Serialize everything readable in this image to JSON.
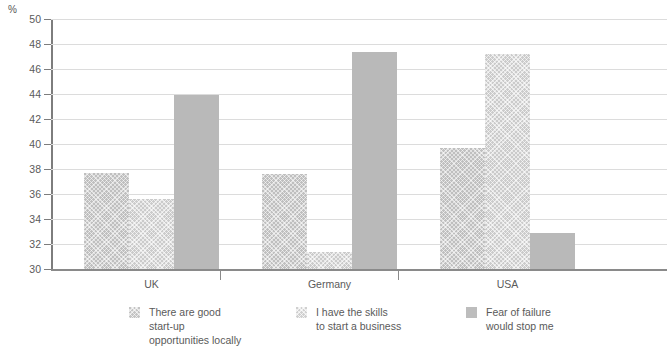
{
  "chart_data": {
    "type": "bar",
    "title": "",
    "subtitle": "",
    "xlabel": "",
    "ylabel": "%",
    "unit_label": "%",
    "categories": [
      "UK",
      "Germany",
      "USA"
    ],
    "series": [
      {
        "name": "There are good\nstart-up\nopportunities locally",
        "legend_label": "There are good\nstart-up\nopportunities locally",
        "color": "#bfbfbf",
        "pattern": "crosshatch",
        "values": [
          37.7,
          37.6,
          39.7
        ]
      },
      {
        "name": "I have the skills\nto start a business",
        "legend_label": "I have the skills\nto start a business",
        "color": "#cbcbcb",
        "pattern": "crosshatch",
        "values": [
          35.6,
          31.4,
          47.2
        ]
      },
      {
        "name": "Fear of failure\nwould stop me",
        "legend_label": "Fear of failure\nwould stop me",
        "color": "#b9b9b9",
        "pattern": "solid",
        "values": [
          43.9,
          47.4,
          32.9
        ]
      }
    ],
    "ylim": [
      30,
      50
    ],
    "ytick_step": 2,
    "yticks": [
      30,
      32,
      34,
      36,
      38,
      40,
      42,
      44,
      46,
      48,
      50
    ],
    "ytick_labels": [
      "30",
      "32",
      "34",
      "36",
      "38",
      "40",
      "42",
      "44",
      "46",
      "48",
      "50"
    ],
    "grid": true,
    "grid_axis": "y",
    "legend_position": "bottom",
    "bar_layout": "grouped-adjacent"
  },
  "top_cropped_text": "",
  "colors": {
    "gridline": "#dcdcdc",
    "axis": "#7d7d7d",
    "baseline": "#8a8a8a",
    "text": "#5a5a5a",
    "background": "#ffffff"
  }
}
